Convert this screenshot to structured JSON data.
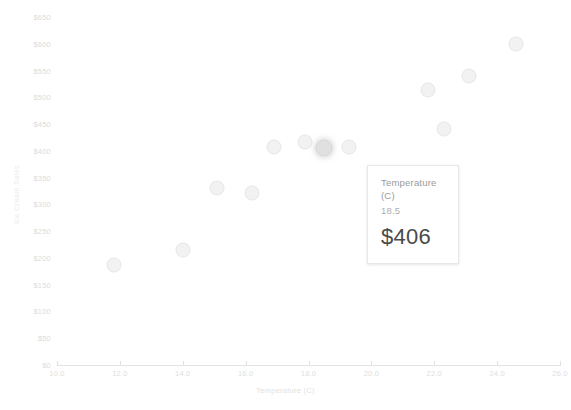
{
  "chart_data": {
    "type": "scatter",
    "title": "",
    "xlabel": "Temperature (C)",
    "ylabel": "Ice Cream Sales",
    "xlim": [
      10.0,
      26.0
    ],
    "ylim": [
      0,
      650
    ],
    "grid": false,
    "legend": null,
    "x_ticks": [
      "10.0",
      "12.0",
      "14.0",
      "16.0",
      "18.0",
      "20.0",
      "22.0",
      "24.0",
      "26.0"
    ],
    "x_tick_values": [
      10.0,
      12.0,
      14.0,
      16.0,
      18.0,
      20.0,
      22.0,
      24.0,
      26.0
    ],
    "y_ticks": [
      "$0",
      "$50",
      "$100",
      "$150",
      "$200",
      "$250",
      "$300",
      "$350",
      "$400",
      "$450",
      "$500",
      "$550",
      "$600",
      "$650"
    ],
    "y_tick_values": [
      0,
      50,
      100,
      150,
      200,
      250,
      300,
      350,
      400,
      450,
      500,
      550,
      600,
      650
    ],
    "points": [
      {
        "x": 11.8,
        "y": 187,
        "highlighted": false
      },
      {
        "x": 14.0,
        "y": 215,
        "highlighted": false
      },
      {
        "x": 15.1,
        "y": 330,
        "highlighted": false
      },
      {
        "x": 16.2,
        "y": 322,
        "highlighted": false
      },
      {
        "x": 16.9,
        "y": 408,
        "highlighted": false
      },
      {
        "x": 17.9,
        "y": 417,
        "highlighted": false
      },
      {
        "x": 18.5,
        "y": 406,
        "highlighted": true
      },
      {
        "x": 19.3,
        "y": 408,
        "highlighted": false
      },
      {
        "x": 21.8,
        "y": 513,
        "highlighted": false
      },
      {
        "x": 22.3,
        "y": 440,
        "highlighted": false
      },
      {
        "x": 23.1,
        "y": 540,
        "highlighted": false
      },
      {
        "x": 24.6,
        "y": 600,
        "highlighted": false
      }
    ]
  },
  "tooltip": {
    "title": "Temperature (C)",
    "subvalue": "18.5",
    "value": "$406"
  }
}
